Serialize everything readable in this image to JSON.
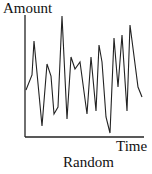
{
  "chart_data": {
    "type": "line",
    "title": "Random",
    "xlabel": "Time",
    "ylabel": "Amount",
    "grid": false,
    "legend": null,
    "ticks": false,
    "x": [
      1,
      2,
      3,
      4,
      5,
      6,
      7,
      8,
      9,
      10,
      11,
      12,
      13,
      14,
      15,
      16,
      17,
      18,
      19,
      20,
      21,
      22,
      23,
      24,
      25,
      26,
      27
    ],
    "values": [
      40,
      55,
      82,
      10,
      62,
      52,
      20,
      26,
      98,
      15,
      68,
      58,
      64,
      20,
      68,
      22,
      79,
      64,
      17,
      3,
      86,
      43,
      88,
      22,
      95,
      43,
      34
    ],
    "ylim": [
      0,
      100
    ],
    "line_color": "#222222",
    "pixels": [
      [
        26,
        90
      ],
      [
        32,
        75
      ],
      [
        34,
        41
      ],
      [
        42,
        126
      ],
      [
        47,
        64
      ],
      [
        51,
        76
      ],
      [
        54,
        114
      ],
      [
        58,
        107
      ],
      [
        62,
        16
      ],
      [
        67,
        119
      ],
      [
        71,
        57
      ],
      [
        75,
        69
      ],
      [
        80,
        62
      ],
      [
        87,
        114
      ],
      [
        91,
        57
      ],
      [
        96,
        111
      ],
      [
        99,
        45
      ],
      [
        102,
        62
      ],
      [
        106,
        117
      ],
      [
        110,
        133
      ],
      [
        114,
        38
      ],
      [
        118,
        87
      ],
      [
        122,
        35
      ],
      [
        127,
        111
      ],
      [
        130,
        25
      ],
      [
        138,
        87
      ],
      [
        142,
        97
      ]
    ]
  },
  "labels": {
    "ylabel": "Amount",
    "xlabel": "Time",
    "title": "Random"
  }
}
